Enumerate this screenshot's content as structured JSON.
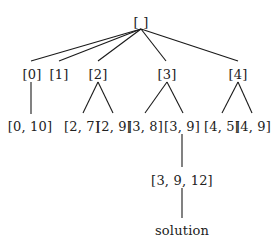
{
  "diagram": {
    "type": "search-tree",
    "nodes": [
      {
        "id": "root",
        "label": "[ ]",
        "x": 141,
        "y": 22
      },
      {
        "id": "n0",
        "label": "[0]",
        "x": 32,
        "y": 74,
        "parent": "root"
      },
      {
        "id": "n1",
        "label": "[1]",
        "x": 59,
        "y": 74,
        "parent": "root"
      },
      {
        "id": "n2",
        "label": "[2]",
        "x": 98,
        "y": 74,
        "parent": "root"
      },
      {
        "id": "n3",
        "label": "[3]",
        "x": 167,
        "y": 74,
        "parent": "root"
      },
      {
        "id": "n4",
        "label": "[4]",
        "x": 238,
        "y": 74,
        "parent": "root"
      },
      {
        "id": "n0_10",
        "label": "[0, 10]",
        "x": 30,
        "y": 126,
        "parent": "n0"
      },
      {
        "id": "n2_7",
        "label": "[2, 7]",
        "x": 82,
        "y": 126,
        "parent": "n2"
      },
      {
        "id": "n2_9",
        "label": "[2, 9]",
        "x": 114,
        "y": 126,
        "parent": "n2"
      },
      {
        "id": "n3_8",
        "label": "[3, 8]",
        "x": 145,
        "y": 126,
        "parent": "n3"
      },
      {
        "id": "n3_9",
        "label": "[3, 9]",
        "x": 182,
        "y": 126,
        "parent": "n3"
      },
      {
        "id": "n4_5",
        "label": "[4, 5]",
        "x": 222,
        "y": 126,
        "parent": "n4"
      },
      {
        "id": "n4_9",
        "label": "[4, 9]",
        "x": 253,
        "y": 126,
        "parent": "n4"
      },
      {
        "id": "n3_9_12",
        "label": "[3, 9, 12]",
        "x": 182,
        "y": 180,
        "parent": "n3_9"
      },
      {
        "id": "solution",
        "label": "solution",
        "x": 182,
        "y": 230,
        "parent": "n3_9_12"
      }
    ],
    "edges": [
      {
        "from": "root",
        "to": "n0",
        "x1": 141,
        "y1": 29,
        "x2": 31,
        "y2": 61
      },
      {
        "from": "root",
        "to": "n1",
        "x1": 141,
        "y1": 29,
        "x2": 59,
        "y2": 61
      },
      {
        "from": "root",
        "to": "n2",
        "x1": 141,
        "y1": 29,
        "x2": 98,
        "y2": 61
      },
      {
        "from": "root",
        "to": "n3",
        "x1": 141,
        "y1": 29,
        "x2": 166,
        "y2": 61
      },
      {
        "from": "root",
        "to": "n4",
        "x1": 141,
        "y1": 29,
        "x2": 238,
        "y2": 61
      },
      {
        "from": "n0",
        "to": "n0_10",
        "x1": 31,
        "y1": 82,
        "x2": 31,
        "y2": 114
      },
      {
        "from": "n2",
        "to": "n2_7",
        "x1": 98,
        "y1": 82,
        "x2": 83,
        "y2": 113
      },
      {
        "from": "n2",
        "to": "n2_9",
        "x1": 98,
        "y1": 82,
        "x2": 113,
        "y2": 113
      },
      {
        "from": "n3",
        "to": "n3_8",
        "x1": 167,
        "y1": 82,
        "x2": 145,
        "y2": 113
      },
      {
        "from": "n3",
        "to": "n3_9",
        "x1": 167,
        "y1": 82,
        "x2": 183,
        "y2": 113
      },
      {
        "from": "n4",
        "to": "n4_5",
        "x1": 238,
        "y1": 82,
        "x2": 222,
        "y2": 113
      },
      {
        "from": "n4",
        "to": "n4_9",
        "x1": 238,
        "y1": 82,
        "x2": 252,
        "y2": 113
      },
      {
        "from": "n3_9",
        "to": "n3_9_12",
        "x1": 182,
        "y1": 134,
        "x2": 182,
        "y2": 167
      },
      {
        "from": "n3_9_12",
        "to": "solution",
        "x1": 182,
        "y1": 188,
        "x2": 182,
        "y2": 218
      }
    ],
    "colors": {
      "line": "#1a1a1a",
      "text": "#222222",
      "background": "#ffffff"
    }
  }
}
